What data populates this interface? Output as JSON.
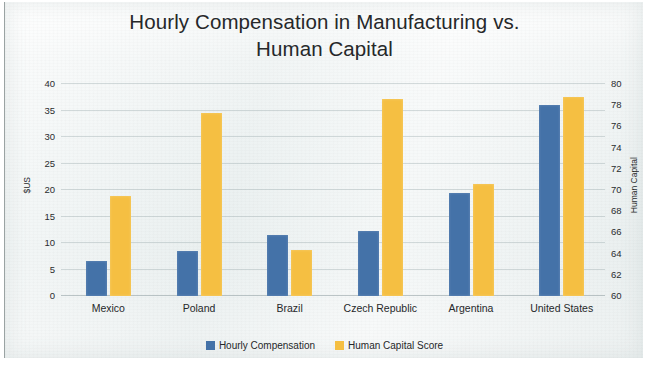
{
  "chart_data": {
    "type": "bar",
    "title": "Hourly Compensation in Manufacturing vs.\nHuman Capital",
    "categories": [
      "Mexico",
      "Poland",
      "Brazil",
      "Czech Republic",
      "Argentina",
      "United States"
    ],
    "series": [
      {
        "name": "Hourly Compensation",
        "axis": "left",
        "color": "#4472A8",
        "values": [
          6.6,
          8.5,
          11.5,
          12.3,
          19.4,
          36.0
        ]
      },
      {
        "name": "Human Capital Score",
        "axis": "right",
        "color": "#F5BF42",
        "values": [
          69.4,
          77.3,
          64.3,
          78.6,
          70.6,
          78.8
        ]
      }
    ],
    "xlabel": "",
    "ylabel": "$US",
    "ylabel_right": "Human Capital",
    "ylim": [
      0,
      40
    ],
    "ylim_right": [
      60,
      80
    ],
    "yticks": [
      0,
      5,
      10,
      15,
      20,
      25,
      30,
      35,
      40
    ],
    "yticks_right": [
      60,
      62,
      64,
      66,
      68,
      70,
      72,
      74,
      76,
      78,
      80
    ],
    "grid": true,
    "legend_position": "bottom"
  },
  "legend": {
    "items": [
      {
        "label": "Hourly Compensation",
        "swatch": "legend-swatch-blue"
      },
      {
        "label": "Human Capital Score",
        "swatch": "legend-swatch-yellow"
      }
    ]
  }
}
